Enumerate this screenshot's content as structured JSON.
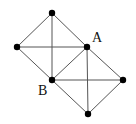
{
  "diagram": {
    "type": "graph",
    "line_color": "#555555",
    "node_color": "#000000",
    "nodes": [
      {
        "id": "top",
        "x": 52,
        "y": 13,
        "label": ""
      },
      {
        "id": "left",
        "x": 17,
        "y": 47,
        "label": ""
      },
      {
        "id": "A",
        "x": 87,
        "y": 47,
        "label": "A"
      },
      {
        "id": "B",
        "x": 52,
        "y": 80,
        "label": "B"
      },
      {
        "id": "right",
        "x": 123,
        "y": 80,
        "label": ""
      },
      {
        "id": "bottom",
        "x": 88,
        "y": 114,
        "label": ""
      }
    ],
    "edges": [
      [
        "top",
        "left"
      ],
      [
        "top",
        "A"
      ],
      [
        "left",
        "B"
      ],
      [
        "A",
        "B"
      ],
      [
        "top",
        "B"
      ],
      [
        "left",
        "A"
      ],
      [
        "A",
        "right"
      ],
      [
        "right",
        "bottom"
      ],
      [
        "bottom",
        "B"
      ],
      [
        "A",
        "bottom"
      ],
      [
        "B",
        "right"
      ]
    ],
    "labels": {
      "A": {
        "text": "A",
        "x": 92,
        "y": 31
      },
      "B": {
        "text": "B",
        "x": 38,
        "y": 84
      }
    }
  }
}
